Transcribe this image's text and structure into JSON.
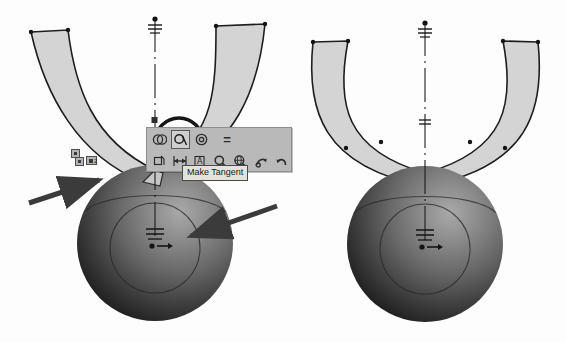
{
  "app": {
    "title": "CAD sketch viewport",
    "background_color": "#fdfdfd"
  },
  "toolbar": {
    "name": "sketch-context-toolbar",
    "background_color": "#b9b9b9",
    "border_color": "#8e8e8e",
    "row1": [
      {
        "id": "coincident",
        "label": "Make Coincident",
        "icon": "coincident-icon",
        "selected": false
      },
      {
        "id": "tangent",
        "label": "Make Tangent",
        "icon": "tangent-icon",
        "selected": true
      },
      {
        "id": "concentric",
        "label": "Make Concentric",
        "icon": "concentric-icon",
        "selected": false
      },
      {
        "id": "equal",
        "label": "Make Equal",
        "icon": "equal-icon",
        "selected": false
      }
    ],
    "row2": [
      {
        "id": "fix",
        "label": "Fix",
        "icon": "fix-icon",
        "selected": false
      },
      {
        "id": "dimension",
        "label": "Smart Dimension",
        "icon": "dimension-icon",
        "selected": false
      },
      {
        "id": "note",
        "label": "Note",
        "icon": "note-a-icon",
        "selected": false
      },
      {
        "id": "zoom-area",
        "label": "Zoom to Area",
        "icon": "magnifier-icon",
        "selected": false
      },
      {
        "id": "zoom-fit",
        "label": "Zoom to Fit",
        "icon": "magnifier-globe-icon",
        "selected": false
      },
      {
        "id": "rotate",
        "label": "Rotate View",
        "icon": "rotate-icon",
        "selected": false
      },
      {
        "id": "undo",
        "label": "Undo",
        "icon": "undo-arrow-icon",
        "selected": false
      }
    ]
  },
  "tooltip": {
    "text": "Make Tangent",
    "background_color": "#e3e3dc",
    "border_color": "#4a4a4a"
  },
  "constraints": {
    "badge_label": "2",
    "badge_color": "#b4b4b4"
  },
  "annotations": {
    "highlight_circle": {
      "name": "tangent-button-highlight-circle",
      "color": "#151515"
    },
    "arrows": [
      {
        "id": "arrow-left",
        "points_to": "tangent edge of left arm",
        "color": "#3b3b3b"
      },
      {
        "id": "arrow-right",
        "points_to": "sphere inner circle",
        "color": "#3b3b3b"
      }
    ]
  },
  "figures": [
    {
      "id": "figure-left",
      "label": "left-sketch-before",
      "sphere": {
        "highlight_color": "#8f8f8f",
        "mid_color": "#5d5d5d",
        "dark_color": "#1b1b1b"
      },
      "arm_fill": "#d4d4d4",
      "arm_stroke": "#1e1e1e",
      "symmetric": false
    },
    {
      "id": "figure-right",
      "label": "right-sketch-after",
      "sphere": {
        "highlight_color": "#8f8f8f",
        "mid_color": "#5d5d5d",
        "dark_color": "#1b1b1b"
      },
      "arm_fill": "#d4d4d4",
      "arm_stroke": "#1e1e1e",
      "symmetric": true
    }
  ]
}
